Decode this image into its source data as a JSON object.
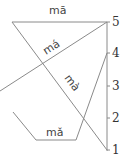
{
  "diagram": {
    "scale": {
      "levels": [
        "5",
        "4",
        "3",
        "2",
        "1"
      ]
    },
    "tones": [
      {
        "name": "tone-1",
        "label": "mā",
        "contour": "55"
      },
      {
        "name": "tone-2",
        "label": "má",
        "contour": "35"
      },
      {
        "name": "tone-3",
        "label": "mǎ",
        "contour": "214"
      },
      {
        "name": "tone-4",
        "label": "mà",
        "contour": "51"
      }
    ],
    "colors": {
      "line": "#8a8a8a",
      "text": "#444444"
    }
  }
}
